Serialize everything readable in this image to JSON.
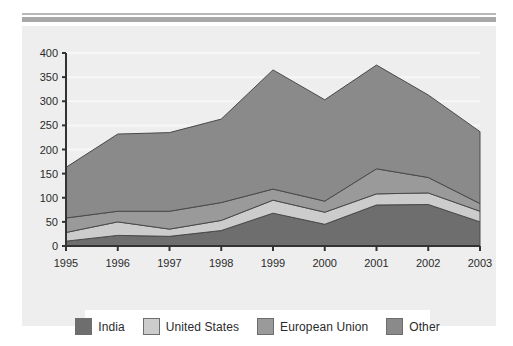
{
  "panel": {
    "background_color": "#eeeeee",
    "top_rule_colors": [
      "#b8b8b8",
      "#a8a8a8"
    ]
  },
  "legend": {
    "position": "bottom",
    "background_color": "#ffffff",
    "items": [
      {
        "label": "India",
        "color": "#6e6e6e"
      },
      {
        "label": "United States",
        "color": "#cccccc"
      },
      {
        "label": "European Union",
        "color": "#9a9a9a"
      },
      {
        "label": "Other",
        "color": "#8a8a8a"
      }
    ]
  },
  "axes": {
    "y_ticks": [
      "0",
      "50",
      "100",
      "150",
      "200",
      "250",
      "300",
      "350",
      "400"
    ],
    "x_ticks": [
      "1995",
      "1996",
      "1997",
      "1998",
      "1999",
      "2000",
      "2001",
      "2002",
      "2003"
    ],
    "y_min": 0,
    "y_max": 400,
    "y_step": 50,
    "axis_color": "#333333",
    "gridline_color": "#f7f7f7"
  },
  "chart_data": {
    "type": "area",
    "stacked": true,
    "title": "",
    "subtitle": "",
    "xlabel": "",
    "ylabel": "",
    "categories": [
      "1995",
      "1996",
      "1997",
      "1998",
      "1999",
      "2000",
      "2001",
      "2002",
      "2003"
    ],
    "ylim": [
      0,
      400
    ],
    "xlim": [
      "1995",
      "2003"
    ],
    "grid": true,
    "legend_position": "bottom",
    "series": [
      {
        "name": "India",
        "color": "#6e6e6e",
        "values": [
          10,
          22,
          20,
          32,
          68,
          45,
          85,
          86,
          50
        ]
      },
      {
        "name": "United States",
        "color": "#cccccc",
        "values": [
          18,
          28,
          15,
          21,
          27,
          25,
          23,
          24,
          22
        ]
      },
      {
        "name": "European Union",
        "color": "#9a9a9a",
        "values": [
          30,
          22,
          37,
          37,
          23,
          23,
          52,
          32,
          16
        ]
      },
      {
        "name": "Other",
        "color": "#8a8a8a",
        "values": [
          105,
          160,
          163,
          173,
          247,
          210,
          215,
          171,
          149
        ]
      }
    ],
    "cumulative_totals": [
      163,
      232,
      235,
      263,
      365,
      303,
      375,
      313,
      237
    ]
  }
}
